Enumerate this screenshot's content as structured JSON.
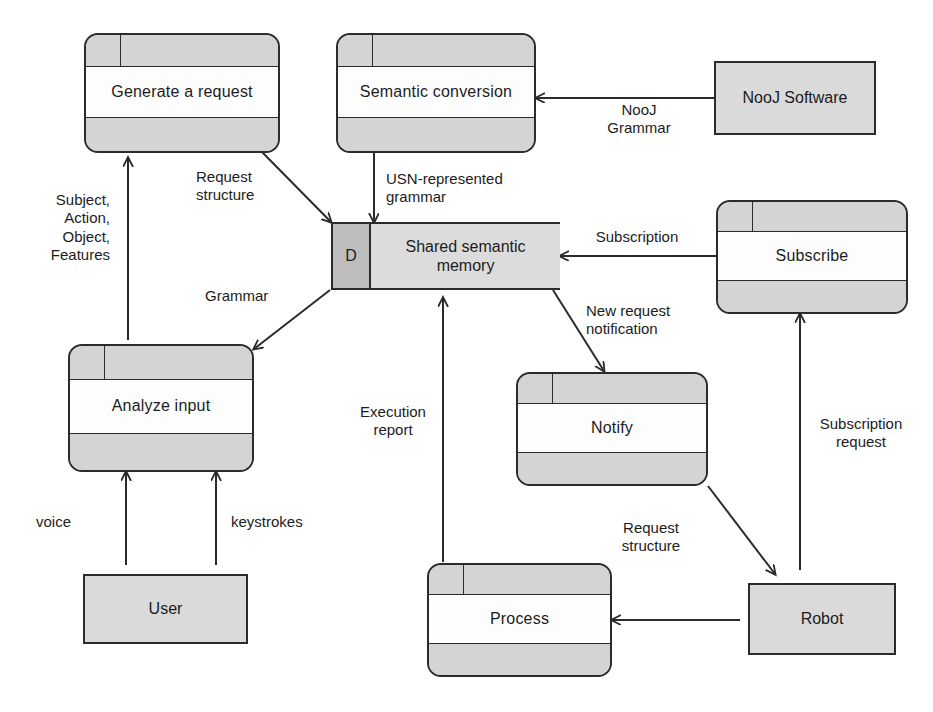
{
  "diagram": {
    "type": "data-flow-diagram",
    "colors": {
      "stroke": "#2b2b2b",
      "process_band": "#d4d4d4",
      "process_body": "#fdfdfd",
      "entity_fill": "#dadada",
      "store_fill": "#dcdcdc",
      "store_dcell_fill": "#bdbdbd",
      "background": "#ffffff"
    }
  },
  "nodes": {
    "generate_request": {
      "label": "Generate a request",
      "kind": "process"
    },
    "semantic_conversion": {
      "label": "Semantic conversion",
      "kind": "process"
    },
    "nooj_software": {
      "label": "NooJ Software",
      "kind": "entity"
    },
    "shared_memory": {
      "id": "D",
      "label": "Shared  semantic\nmemory",
      "kind": "data-store"
    },
    "subscribe": {
      "label": "Subscribe",
      "kind": "process"
    },
    "analyze_input": {
      "label": "Analyze input",
      "kind": "process"
    },
    "notify": {
      "label": "Notify",
      "kind": "process"
    },
    "user": {
      "label": "User",
      "kind": "entity"
    },
    "process": {
      "label": "Process",
      "kind": "process"
    },
    "robot": {
      "label": "Robot",
      "kind": "entity"
    }
  },
  "flows": {
    "subject_action_object_features": "Subject,\nAction,\nObject,\nFeatures",
    "request_structure_top": "Request\nstructure",
    "usn_represented_grammar": "USN-represented\ngrammar",
    "nooj_grammar": "NooJ\nGrammar",
    "subscription": "Subscription",
    "grammar": "Grammar",
    "new_request_notification": "New request\nnotification",
    "execution_report": "Execution\nreport",
    "subscription_request": "Subscription\nrequest",
    "request_structure_bottom": "Request\nstructure",
    "voice": "voice",
    "keystrokes": "keystrokes"
  }
}
